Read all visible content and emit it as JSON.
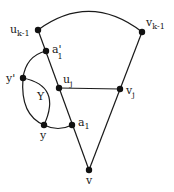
{
  "diagram": {
    "colors": {
      "line": "#1a1a1a",
      "node": "#111111",
      "background": "#ffffff"
    },
    "nodes": [
      {
        "id": "u_k-1",
        "label": "u",
        "sub": "k-1",
        "x": 38,
        "y": 30
      },
      {
        "id": "v_k-1",
        "label": "v",
        "sub": "k-1",
        "x": 142,
        "y": 32
      },
      {
        "id": "a'_1",
        "label": "a'",
        "sub": "1",
        "x": 46,
        "y": 51
      },
      {
        "id": "y'",
        "label": "y'",
        "sub": "",
        "x": 23,
        "y": 78
      },
      {
        "id": "u_j",
        "label": "u",
        "sub": "j",
        "x": 59,
        "y": 88
      },
      {
        "id": "v_j",
        "label": "v",
        "sub": "j",
        "x": 120,
        "y": 89
      },
      {
        "id": "y",
        "label": "y",
        "sub": "",
        "x": 44,
        "y": 125
      },
      {
        "id": "a_1",
        "label": "a",
        "sub": "1",
        "x": 72,
        "y": 125
      },
      {
        "id": "v",
        "label": "v",
        "sub": "",
        "x": 89,
        "y": 170
      }
    ],
    "region_label": "Y",
    "edges": [
      "u_k-1 — v_k-1 (arc)",
      "u_k-1 — a'_1 — u_j — a_1 — v",
      "v_k-1 — v_j — v",
      "u_j — v_j",
      "a'_1 — y' (arc)",
      "y' — y (arc)",
      "y' — y (inner arc)",
      "y — a_1 (arc)"
    ]
  }
}
